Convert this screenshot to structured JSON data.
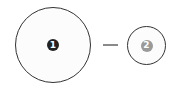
{
  "diagram": {
    "nodes": [
      {
        "id": "node-1",
        "label": "1",
        "size": "large",
        "badge_color": "#222222",
        "outline_color": "#333333"
      },
      {
        "id": "node-2",
        "label": "2",
        "size": "small",
        "badge_color": "#9a9a9a",
        "outline_color": "#333333"
      }
    ],
    "edges": [
      {
        "from": "node-1",
        "to": "node-2",
        "style": "dash",
        "color": "#8a8a8a"
      }
    ]
  }
}
